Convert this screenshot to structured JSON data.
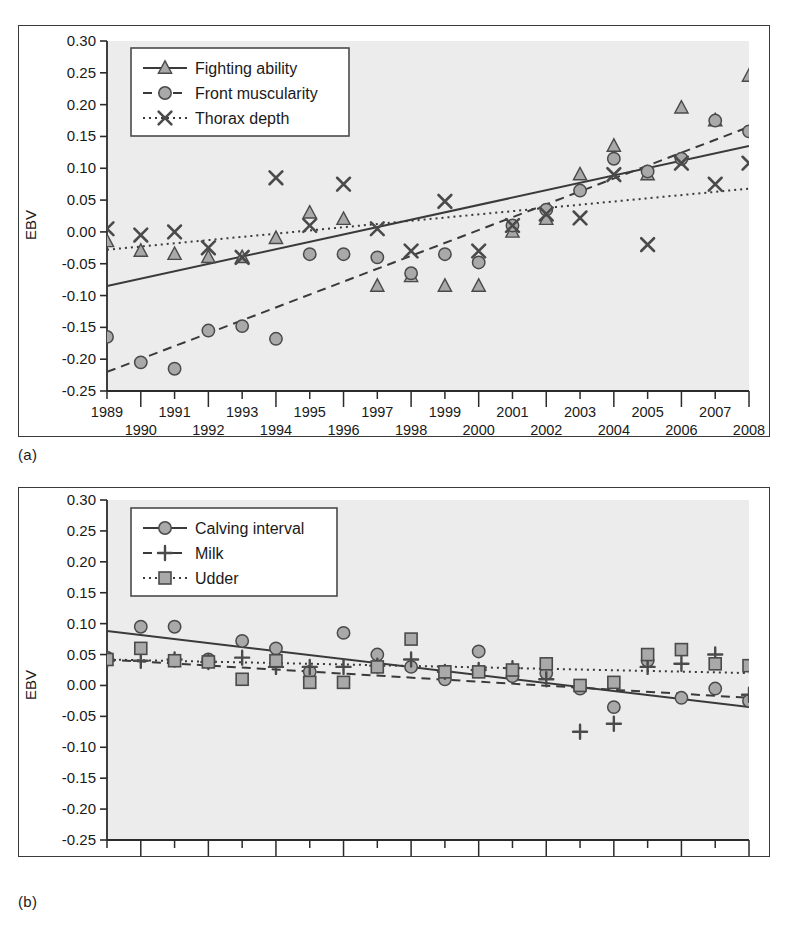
{
  "figure": {
    "panel_a_caption": "(a)",
    "panel_b_caption": "(b)"
  },
  "chart_data": [
    {
      "id": "panel-a",
      "type": "scatter",
      "title": "",
      "xlabel": "",
      "ylabel": "EBV",
      "xlim": [
        1989,
        2008
      ],
      "ylim": [
        -0.25,
        0.3
      ],
      "ytick_step": 0.05,
      "grid": false,
      "legend_position": "top-left",
      "x": [
        1989,
        1990,
        1991,
        1992,
        1993,
        1994,
        1995,
        1996,
        1997,
        1998,
        1999,
        2000,
        2001,
        2002,
        2003,
        2004,
        2005,
        2006,
        2007,
        2008
      ],
      "xtick_labels": [
        "1989",
        "1990",
        "1991",
        "1992",
        "1993",
        "1994",
        "1995",
        "1996",
        "1997",
        "1998",
        "1999",
        "2000",
        "2001",
        "2002",
        "2003",
        "2004",
        "2005",
        "2006",
        "2007",
        "2008"
      ],
      "ytick_labels": [
        "0.30",
        "0.25",
        "0.20",
        "0.15",
        "0.10",
        "0.05",
        "0.00",
        "-0.05",
        "-0.10",
        "-0.15",
        "-0.20",
        "-0.25"
      ],
      "series": [
        {
          "name": "Fighting ability",
          "marker": "triangle",
          "line_style": "solid",
          "values": [
            -0.015,
            -0.03,
            -0.035,
            -0.04,
            -0.04,
            -0.01,
            0.03,
            0.02,
            -0.085,
            -0.07,
            -0.085,
            -0.085,
            0.0,
            0.02,
            0.09,
            0.135,
            0.09,
            0.195,
            0.175,
            0.245
          ],
          "trend": {
            "start": -0.085,
            "end": 0.135
          }
        },
        {
          "name": "Front muscularity",
          "marker": "circle",
          "line_style": "dashed",
          "values": [
            -0.165,
            -0.205,
            -0.215,
            -0.155,
            -0.148,
            -0.168,
            -0.035,
            -0.035,
            -0.04,
            -0.065,
            -0.035,
            -0.048,
            0.01,
            0.035,
            0.065,
            0.115,
            0.095,
            0.115,
            0.175,
            0.158
          ],
          "trend": {
            "start": -0.22,
            "end": 0.165
          }
        },
        {
          "name": "Thorax depth",
          "marker": "x",
          "line_style": "dotted",
          "values": [
            0.005,
            -0.005,
            0.0,
            -0.025,
            -0.04,
            0.085,
            0.01,
            0.075,
            0.005,
            -0.03,
            0.048,
            -0.03,
            0.01,
            0.028,
            0.022,
            0.09,
            -0.02,
            0.108,
            0.075,
            0.108
          ],
          "trend": {
            "start": -0.028,
            "end": 0.068
          }
        }
      ]
    },
    {
      "id": "panel-b",
      "type": "scatter",
      "title": "",
      "xlabel": "",
      "ylabel": "EBV",
      "xlim": [
        1989,
        2008
      ],
      "ylim": [
        -0.25,
        0.3
      ],
      "ytick_step": 0.05,
      "grid": false,
      "legend_position": "top-left",
      "x": [
        1989,
        1990,
        1991,
        1992,
        1993,
        1994,
        1995,
        1996,
        1997,
        1998,
        1999,
        2000,
        2001,
        2002,
        2003,
        2004,
        2005,
        2006,
        2007,
        2008
      ],
      "xtick_labels": [
        "1989",
        "1990",
        "1991",
        "1992",
        "1993",
        "1994",
        "1995",
        "1996",
        "1997",
        "1998",
        "1999",
        "2000",
        "2001",
        "2002",
        "2003",
        "2004",
        "2005",
        "2006",
        "2007",
        "2008"
      ],
      "ytick_labels": [
        "0.30",
        "0.25",
        "0.20",
        "0.15",
        "0.10",
        "0.05",
        "0.00",
        "-0.05",
        "-0.10",
        "-0.15",
        "-0.20",
        "-0.25"
      ],
      "series": [
        {
          "name": "Calving interval",
          "marker": "circle",
          "line_style": "solid",
          "values": [
            0.045,
            0.095,
            0.095,
            0.042,
            0.072,
            0.06,
            0.022,
            0.085,
            0.05,
            0.03,
            0.01,
            0.055,
            0.015,
            0.02,
            -0.005,
            -0.035,
            0.04,
            -0.02,
            -0.005,
            -0.025
          ],
          "trend": {
            "start": 0.088,
            "end": -0.035
          }
        },
        {
          "name": "Milk",
          "marker": "plus",
          "line_style": "dashed",
          "values": [
            0.04,
            0.04,
            0.042,
            0.038,
            0.045,
            0.03,
            0.03,
            0.03,
            0.032,
            0.042,
            0.022,
            0.025,
            0.028,
            0.01,
            -0.075,
            -0.062,
            0.03,
            0.035,
            0.05,
            -0.015
          ],
          "trend": {
            "start": 0.042,
            "end": -0.02
          }
        },
        {
          "name": "Udder",
          "marker": "square",
          "line_style": "dotted",
          "values": [
            0.042,
            0.06,
            0.04,
            0.038,
            0.01,
            0.04,
            0.005,
            0.005,
            0.03,
            0.075,
            0.022,
            0.022,
            0.025,
            0.035,
            0.0,
            0.005,
            0.05,
            0.058,
            0.035,
            0.032
          ],
          "trend": {
            "start": 0.042,
            "end": 0.02
          }
        }
      ]
    }
  ],
  "style": {
    "plot_background": "#ececec",
    "marker_fill": "#a9a9a9",
    "marker_stroke": "#4a4a4a",
    "axis_color": "#2b2b2b",
    "line_color": "#3a3a3a",
    "legend_border": "#4a4a4a",
    "legend_background": "#ffffff"
  }
}
